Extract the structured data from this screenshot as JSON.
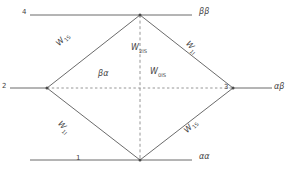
{
  "figure": {
    "type": "diamond-network-diagram",
    "background": "#ffffff",
    "line_color": "#6b6b6b",
    "dash_color": "#8a8a8a",
    "text_color": "#4a4a4a"
  },
  "nodes": [
    {
      "id": "n1",
      "label": "1",
      "x": 140,
      "y": 160,
      "role": "bottom-vertex"
    },
    {
      "id": "n2",
      "label": "2",
      "x": 47,
      "y": 88,
      "role": "left-vertex"
    },
    {
      "id": "n3",
      "label": "3",
      "x": 233,
      "y": 88,
      "role": "right-vertex"
    },
    {
      "id": "n4",
      "label": "4",
      "x": 140,
      "y": 15,
      "role": "top-vertex"
    }
  ],
  "node_labels": {
    "top": "4",
    "left": "2",
    "right": "3",
    "bottom": "1"
  },
  "state_labels": {
    "top_right": "ββ",
    "right": "αβ",
    "bottom_right": "αα",
    "left_center": "βα"
  },
  "edge_labels": {
    "upper_left": {
      "base": "W",
      "sub": "1S"
    },
    "upper_right": {
      "base": "W",
      "sub": "1I"
    },
    "lower_left": {
      "base": "W",
      "sub": "1I"
    },
    "lower_right": {
      "base": "W",
      "sub": "1S"
    },
    "vertical_dashed": {
      "base": "W",
      "sub": "2IS"
    },
    "horizontal_dashed": {
      "base": "W",
      "sub": "0IS"
    }
  }
}
